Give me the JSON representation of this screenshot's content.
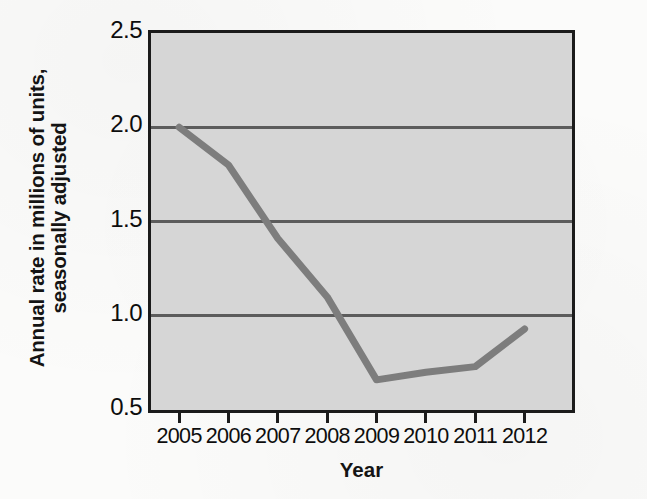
{
  "chart_data": {
    "type": "line",
    "title": "",
    "subtitle": "",
    "xlabel": "Year",
    "ylabel": "Annual rate in millions of units, seasonally adjusted",
    "ylabel_line1": "Annual rate in millions of units,",
    "ylabel_line2": "seasonally adjusted",
    "categories": [
      "2005",
      "2006",
      "2007",
      "2008",
      "2009",
      "2010",
      "2011",
      "2012"
    ],
    "x": [
      2005,
      2006,
      2007,
      2008,
      2009,
      2010,
      2011,
      2012
    ],
    "values": [
      2.0,
      1.8,
      1.41,
      1.1,
      0.66,
      0.7,
      0.73,
      0.93
    ],
    "series": [
      {
        "name": "Annual rate",
        "values": [
          2.0,
          1.8,
          1.41,
          1.1,
          0.66,
          0.7,
          0.73,
          0.93
        ]
      }
    ],
    "xlim": [
      2004.43,
      2012.96
    ],
    "ylim": [
      0.5,
      2.5
    ],
    "ytick_labels": [
      "0.5",
      "1.0",
      "1.5",
      "2.0",
      "2.5"
    ],
    "ytick_values": [
      0.5,
      1.0,
      1.5,
      2.0,
      2.5
    ],
    "xtick_labels": [
      "2005",
      "2006",
      "2007",
      "2008",
      "2009",
      "2010",
      "2011",
      "2012"
    ],
    "gridlines": [
      1.0,
      1.5,
      2.0
    ],
    "grid": true,
    "grid_axis": "y",
    "legend": false,
    "legend_position": "none",
    "annotations": [],
    "colors": {
      "line": "#7d7d7d",
      "plot_background": "#d6d6d6",
      "page_background": "#fbfbfa",
      "axis": "#1b1b1b",
      "gridline": "#5c5c5c",
      "text": "#0d0d0d"
    },
    "line_width_px": 7
  }
}
